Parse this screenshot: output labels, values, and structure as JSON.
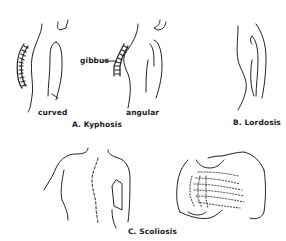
{
  "figure": {
    "panels": [
      {
        "id": "A",
        "caption": "A. Kyphosis",
        "sublabels": [
          "curved",
          "angular"
        ],
        "annotation": "gibbus"
      },
      {
        "id": "B",
        "caption": "B. Lordosis"
      },
      {
        "id": "C",
        "caption": "C. Scoliosis"
      }
    ]
  }
}
